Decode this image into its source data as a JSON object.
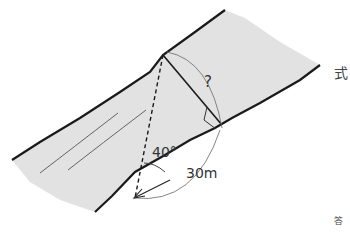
{
  "diagram": {
    "title": "",
    "labels": {
      "unknown_width": "?",
      "angle": "40°",
      "distance": "30m"
    },
    "side_text": {
      "right_top": "式",
      "right_bottom": "答"
    },
    "colors": {
      "river_fill": "#e2e2e2",
      "bank_line": "#1a1a1a",
      "arc": "#777777",
      "text": "#333333"
    }
  }
}
